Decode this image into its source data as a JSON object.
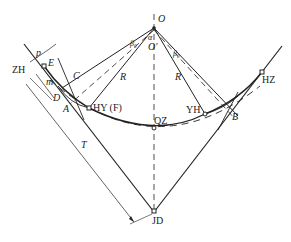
{
  "diagram": {
    "title": "",
    "points": {
      "O": "O",
      "O_prime": "O'",
      "ZH": "ZH",
      "HY": "HY (F)",
      "QZ": "QZ",
      "YH": "YH",
      "HZ": "HZ",
      "JD": "JD",
      "A": "A",
      "B": "B",
      "C": "C",
      "D": "D",
      "E": "E"
    },
    "dimensions": {
      "p": "p",
      "m": "m",
      "T": "T",
      "R_left": "R",
      "R_right": "R",
      "beta_left": "β₀",
      "beta_right": "β₀",
      "alpha": "α"
    },
    "colors": {
      "line": "#222222",
      "background": "#ffffff"
    }
  }
}
